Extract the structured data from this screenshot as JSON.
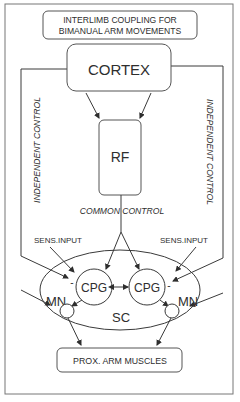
{
  "title": {
    "line1": "INTERLIMB COUPLING FOR",
    "line2": "BIMANUAL ARM MOVEMENTS"
  },
  "nodes": {
    "cortex": "CORTEX",
    "rf": "RF",
    "sc": "SC",
    "cpg_left": "CPG",
    "cpg_right": "CPG",
    "mn_left": "MN",
    "mn_right": "MN",
    "muscles": "PROX. ARM MUSCLES"
  },
  "labels": {
    "independent_left": "INDEPENDENT CONTROL",
    "independent_right": "INDEPENDENT CONTROL",
    "common": "COMMON CONTROL",
    "sens_input_left": "SENS.INPUT",
    "sens_input_right": "SENS.INPUT",
    "minus_left": "-",
    "minus_right": "-"
  },
  "colors": {
    "line": "#3a3a3a",
    "text": "#2e2e2e",
    "frame": "#777777",
    "background": "#ffffff"
  }
}
